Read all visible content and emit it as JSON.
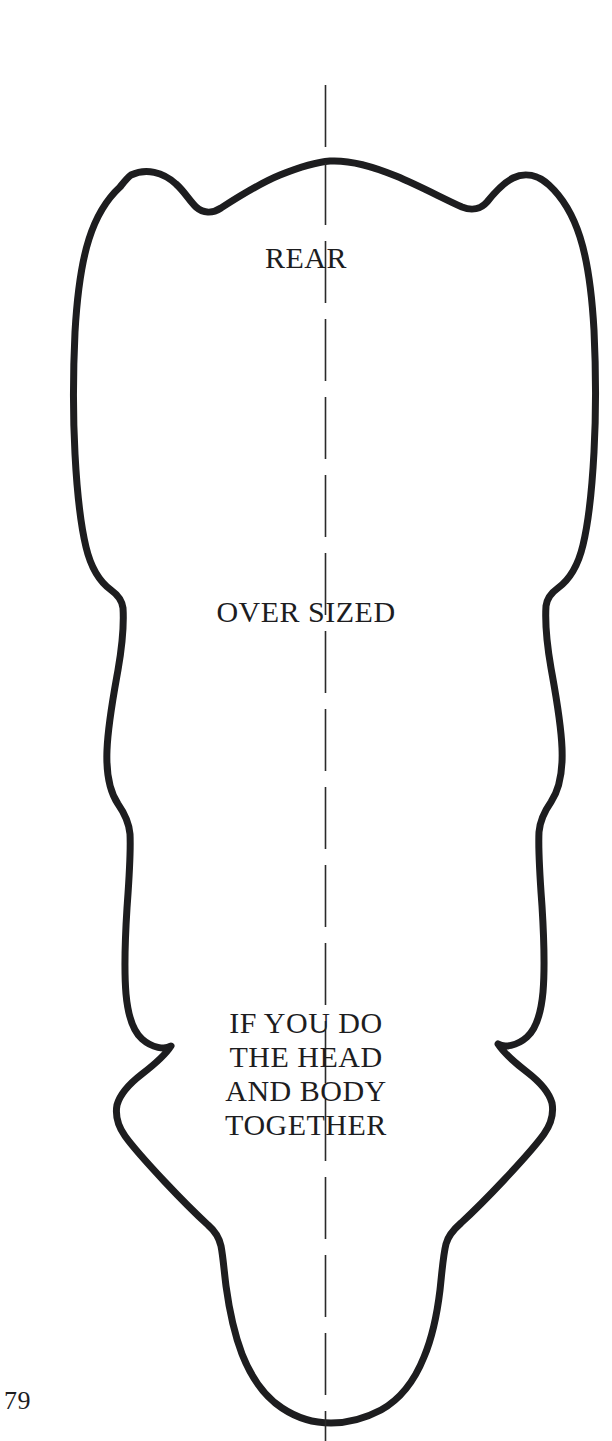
{
  "page": {
    "page_number": "79",
    "background_color": "#ffffff",
    "ink_color": "#1d1d1f",
    "width": 612,
    "height": 1441
  },
  "diagram": {
    "name": "hide-pattern-outline",
    "outline_color": "#1d1d1f",
    "outline_width": 7,
    "centerline": {
      "color": "#2a2a2a",
      "width": 1.6,
      "dash": "62 16",
      "x": 325,
      "y_top": 85,
      "y_bottom": 1441
    }
  },
  "labels": {
    "rear": "REAR",
    "oversized": "OVER SIZED",
    "note_lines": [
      "IF YOU DO",
      "THE HEAD",
      "AND BODY",
      "TOGETHER"
    ]
  }
}
